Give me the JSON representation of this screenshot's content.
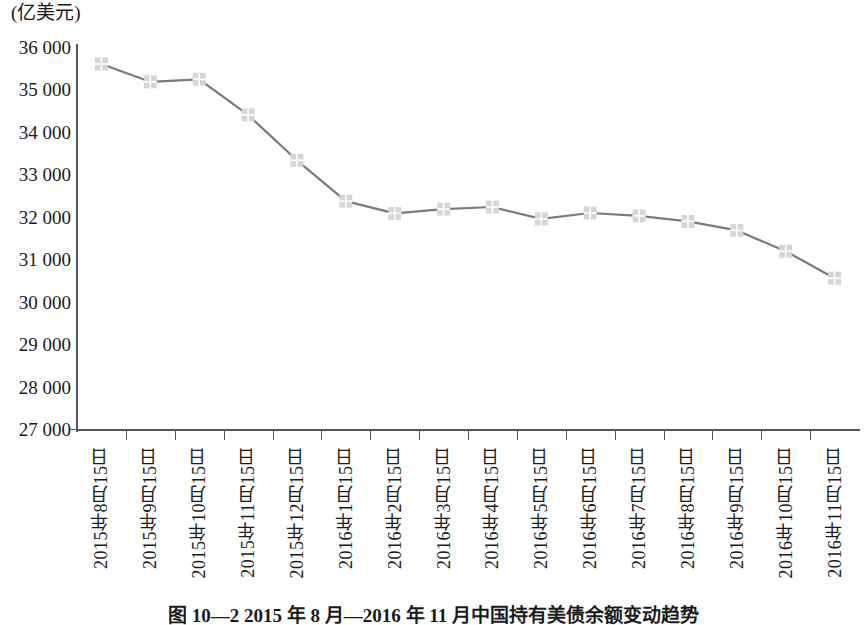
{
  "figure": {
    "unit_label": "(亿美元)",
    "caption": "图 10—2  2015 年 8 月—2016 年 11 月中国持有美债余额变动趋势"
  },
  "chart_data": {
    "type": "line",
    "title": "",
    "subtitle": "",
    "xlabel": "",
    "ylabel": "(亿美元)",
    "ylim": [
      27000,
      36000
    ],
    "ytick_step": 1000,
    "grid": false,
    "legend": null,
    "marker": "square-cross",
    "line_color": "#7a7a7e",
    "marker_color": "#d6d6d8",
    "axis_color": "#55555a",
    "categories": [
      "2015年8月15日",
      "2015年9月15日",
      "2015年10月15日",
      "2015年11月15日",
      "2015年12月15日",
      "2016年1月15日",
      "2016年2月15日",
      "2016年3月15日",
      "2016年4月15日",
      "2016年5月15日",
      "2016年6月15日",
      "2016年7月15日",
      "2016年8月15日",
      "2016年9月15日",
      "2016年10月15日",
      "2016年11月15日"
    ],
    "ytick_labels": [
      "36 000",
      "35 000",
      "34 000",
      "33 000",
      "32 000",
      "31 000",
      "30 000",
      "29 000",
      "28 000",
      "27 000"
    ],
    "ytick_values": [
      36000,
      35000,
      34000,
      33000,
      32000,
      31000,
      30000,
      29000,
      28000,
      27000
    ],
    "values": [
      35600,
      35180,
      35240,
      34400,
      33330,
      32370,
      32080,
      32180,
      32230,
      31950,
      32090,
      32020,
      31890,
      31680,
      31190,
      30550
    ],
    "series": [
      {
        "name": "中国持有美国国债余额",
        "values": [
          35600,
          35180,
          35240,
          34400,
          33330,
          32370,
          32080,
          32180,
          32230,
          31950,
          32090,
          32020,
          31890,
          31680,
          31190,
          30550
        ]
      }
    ]
  }
}
